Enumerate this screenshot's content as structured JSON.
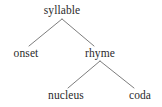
{
  "diagram": {
    "type": "syllable-structure-tree",
    "title": "",
    "line_color": "#6e6e6e",
    "text_color": "#2b2b2b",
    "background_color": "#ffffff",
    "nodes": [
      {
        "id": "syllable",
        "label": "syllable",
        "level": 0,
        "x": 62,
        "y": 10
      },
      {
        "id": "onset",
        "label": "onset",
        "level": 1,
        "x": 26,
        "y": 53
      },
      {
        "id": "rhyme",
        "label": "rhyme",
        "level": 1,
        "x": 100,
        "y": 53
      },
      {
        "id": "nucleus",
        "label": "nucleus",
        "level": 2,
        "x": 66,
        "y": 95
      },
      {
        "id": "coda",
        "label": "coda",
        "level": 2,
        "x": 140,
        "y": 95
      }
    ],
    "edges": [
      {
        "from": "syllable",
        "to": "onset",
        "x1": 62,
        "y1": 19,
        "x2": 29,
        "y2": 46
      },
      {
        "from": "syllable",
        "to": "rhyme",
        "x1": 62,
        "y1": 19,
        "x2": 94,
        "y2": 46
      },
      {
        "from": "rhyme",
        "to": "nucleus",
        "x1": 100,
        "y1": 61,
        "x2": 68,
        "y2": 88
      },
      {
        "from": "rhyme",
        "to": "coda",
        "x1": 100,
        "y1": 61,
        "x2": 134,
        "y2": 88
      }
    ]
  }
}
